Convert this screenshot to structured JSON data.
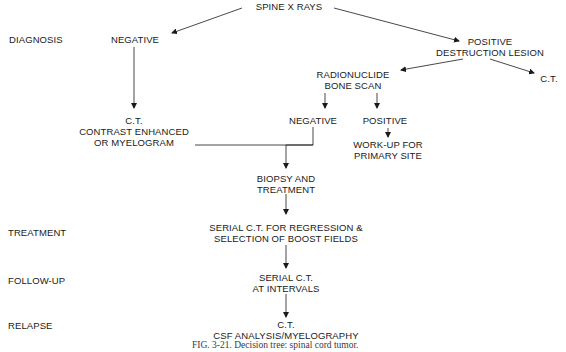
{
  "diagram": {
    "type": "decision-tree",
    "stages": {
      "diagnosis": "DIAGNOSIS",
      "treatment": "TREATMENT",
      "follow_up": "FOLLOW-UP",
      "relapse": "RELAPSE"
    },
    "nodes": {
      "root": "SPINE X RAYS",
      "negative": "NEGATIVE",
      "positive_line1": "POSITIVE",
      "positive_line2": "DESTRUCTION LESION",
      "ct_right": "C.T.",
      "radionuclide_line1": "RADIONUCLIDE",
      "radionuclide_line2": "BONE SCAN",
      "ct_contrast_line1": "C.T.",
      "ct_contrast_line2": "CONTRAST ENHANCED",
      "ct_contrast_line3": "OR MYELOGRAM",
      "scan_negative": "NEGATIVE",
      "scan_positive": "POSITIVE",
      "workup_line1": "WORK-UP FOR",
      "workup_line2": "PRIMARY SITE",
      "biopsy_line1": "BIOPSY AND",
      "biopsy_line2": "TREATMENT",
      "serial_regression_line1": "SERIAL C.T. FOR REGRESSION &",
      "serial_regression_line2": "SELECTION OF BOOST FIELDS",
      "serial_intervals_line1": "SERIAL C.T.",
      "serial_intervals_line2": "AT INTERVALS",
      "relapse_line1": "C.T.",
      "relapse_line2": "CSF ANALYSIS/MYELOGRAPHY"
    },
    "edges": [
      {
        "from": "SPINE X RAYS",
        "to": "NEGATIVE"
      },
      {
        "from": "SPINE X RAYS",
        "to": "POSITIVE DESTRUCTION LESION"
      },
      {
        "from": "POSITIVE DESTRUCTION LESION",
        "to": "RADIONUCLIDE BONE SCAN"
      },
      {
        "from": "POSITIVE DESTRUCTION LESION",
        "to": "C.T."
      },
      {
        "from": "NEGATIVE",
        "to": "C.T. CONTRAST ENHANCED OR MYELOGRAM"
      },
      {
        "from": "RADIONUCLIDE BONE SCAN",
        "to": "NEGATIVE (scan)"
      },
      {
        "from": "RADIONUCLIDE BONE SCAN",
        "to": "POSITIVE (scan)"
      },
      {
        "from": "POSITIVE (scan)",
        "to": "WORK-UP FOR PRIMARY SITE"
      },
      {
        "from": "C.T. CONTRAST ENHANCED OR MYELOGRAM",
        "to": "BIOPSY AND TREATMENT"
      },
      {
        "from": "NEGATIVE (scan)",
        "to": "BIOPSY AND TREATMENT"
      },
      {
        "from": "BIOPSY AND TREATMENT",
        "to": "SERIAL C.T. FOR REGRESSION & SELECTION OF BOOST FIELDS"
      },
      {
        "from": "SERIAL C.T. FOR REGRESSION & SELECTION OF BOOST FIELDS",
        "to": "SERIAL C.T. AT INTERVALS"
      },
      {
        "from": "SERIAL C.T. AT INTERVALS",
        "to": "C.T. CSF ANALYSIS/MYELOGRAPHY"
      }
    ],
    "caption": "FIG. 3-21. Decision tree: spinal cord tumor."
  }
}
